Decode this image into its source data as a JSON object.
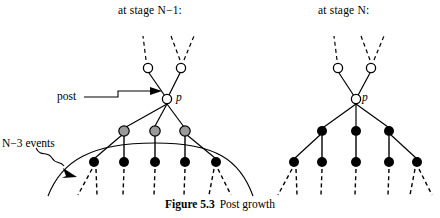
{
  "figure": {
    "caption_number": "Figure 5.3",
    "caption_text": "Post growth",
    "headings": {
      "left": "at stage N−1:",
      "right": "at stage N:"
    },
    "annotations": {
      "post_label": "post",
      "events_label": "N−3 events",
      "post_node_letter": "p",
      "right_post_node_letter": "p"
    },
    "colors": {
      "stroke": "#000000",
      "open_node_fill": "#ffffff",
      "gray_node_fill": "#9a9a9a",
      "black_node_fill": "#000000",
      "background": "#ffffff"
    },
    "left_tree": {
      "post_node": {
        "x": 167,
        "y": 99,
        "style": "open"
      },
      "upper_open_nodes": [
        {
          "x": 148,
          "y": 68,
          "style": "open"
        },
        {
          "x": 181,
          "y": 68,
          "style": "open"
        }
      ],
      "upper_dashes": [
        {
          "x1": 146,
          "y1": 60,
          "x2": 143,
          "y2": 36
        },
        {
          "x1": 180,
          "y1": 60,
          "x2": 171,
          "y2": 36
        },
        {
          "x1": 184,
          "y1": 60,
          "x2": 194,
          "y2": 36
        }
      ],
      "gray_nodes": [
        {
          "x": 124,
          "y": 131,
          "style": "gray"
        },
        {
          "x": 155,
          "y": 131,
          "style": "gray"
        },
        {
          "x": 185,
          "y": 131,
          "style": "gray"
        }
      ],
      "black_nodes": [
        {
          "x": 94,
          "y": 162,
          "style": "black"
        },
        {
          "x": 124,
          "y": 162,
          "style": "black"
        },
        {
          "x": 155,
          "y": 162,
          "style": "black"
        },
        {
          "x": 185,
          "y": 162,
          "style": "black"
        },
        {
          "x": 216,
          "y": 162,
          "style": "black"
        }
      ],
      "lower_dashes": [
        {
          "x1": 92,
          "y1": 170,
          "x2": 76,
          "y2": 196
        },
        {
          "x1": 96,
          "y1": 170,
          "x2": 96,
          "y2": 196
        },
        {
          "x1": 124,
          "y1": 170,
          "x2": 122,
          "y2": 196
        },
        {
          "x1": 155,
          "y1": 170,
          "x2": 154,
          "y2": 196
        },
        {
          "x1": 185,
          "y1": 170,
          "x2": 184,
          "y2": 196
        },
        {
          "x1": 214,
          "y1": 170,
          "x2": 208,
          "y2": 196
        },
        {
          "x1": 218,
          "y1": 170,
          "x2": 230,
          "y2": 196
        }
      ]
    },
    "right_tree": {
      "post_node": {
        "x": 356,
        "y": 99,
        "style": "open"
      },
      "upper_open_nodes": [
        {
          "x": 338,
          "y": 68,
          "style": "open"
        },
        {
          "x": 371,
          "y": 68,
          "style": "open"
        }
      ],
      "upper_dashes": [
        {
          "x1": 337,
          "y1": 60,
          "x2": 334,
          "y2": 36
        },
        {
          "x1": 370,
          "y1": 60,
          "x2": 361,
          "y2": 36
        },
        {
          "x1": 374,
          "y1": 60,
          "x2": 384,
          "y2": 36
        }
      ],
      "mid_black_nodes": [
        {
          "x": 322,
          "y": 131,
          "style": "black"
        },
        {
          "x": 356,
          "y": 131,
          "style": "black"
        },
        {
          "x": 389,
          "y": 131,
          "style": "black"
        }
      ],
      "black_nodes": [
        {
          "x": 294,
          "y": 162,
          "style": "black"
        },
        {
          "x": 322,
          "y": 162,
          "style": "black"
        },
        {
          "x": 356,
          "y": 162,
          "style": "black"
        },
        {
          "x": 389,
          "y": 162,
          "style": "black"
        },
        {
          "x": 417,
          "y": 162,
          "style": "black"
        }
      ],
      "lower_dashes": [
        {
          "x1": 292,
          "y1": 170,
          "x2": 277,
          "y2": 196
        },
        {
          "x1": 296,
          "y1": 170,
          "x2": 296,
          "y2": 196
        },
        {
          "x1": 322,
          "y1": 170,
          "x2": 321,
          "y2": 196
        },
        {
          "x1": 356,
          "y1": 170,
          "x2": 355,
          "y2": 196
        },
        {
          "x1": 389,
          "y1": 170,
          "x2": 388,
          "y2": 196
        },
        {
          "x1": 415,
          "y1": 170,
          "x2": 409,
          "y2": 196
        },
        {
          "x1": 419,
          "y1": 170,
          "x2": 431,
          "y2": 196
        }
      ]
    }
  }
}
